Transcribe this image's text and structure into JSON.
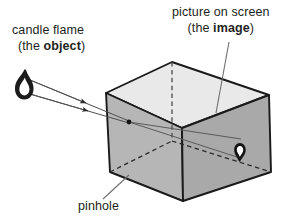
{
  "figure": {
    "labels": {
      "object_line1": "candle flame",
      "object_line2_pre": "(the ",
      "object_line2_bold": "object",
      "object_line2_post": ")",
      "image_line1": "picture on screen",
      "image_line2_pre": "(the ",
      "image_line2_bold": "image",
      "image_line2_post": ")",
      "pinhole": "pinhole"
    },
    "colors": {
      "background": "#ffffff",
      "outline": "#1a1a1a",
      "top_face": "#e8e8e8",
      "left_face": "#b4b4b4",
      "right_face": "#a8a8a8",
      "ray": "#555555",
      "leader": "#777777",
      "flame_outline": "#141414",
      "flame_inner": "#ffffff"
    },
    "geometry": {
      "box_top_back": [
        172,
        62
      ],
      "box_top_left": [
        106,
        93
      ],
      "box_top_front": [
        182,
        128
      ],
      "box_top_right": [
        269,
        95
      ],
      "box_bottom_left": [
        110,
        172
      ],
      "box_bottom_front": [
        183,
        201
      ],
      "box_bottom_right": [
        271,
        172
      ],
      "box_bottom_back_hidden": [
        172,
        141
      ],
      "pinhole_point": [
        129,
        122
      ],
      "object_flame": [
        24,
        84
      ],
      "image_flame": [
        240,
        148
      ]
    }
  }
}
